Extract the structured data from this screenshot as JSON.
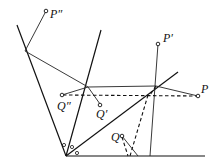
{
  "diagram": {
    "title": "",
    "labels": {
      "p_double_prime": "P″",
      "p_prime": "P′",
      "p": "P",
      "q_double_prime": "Q″",
      "q_prime": "Q′",
      "q": "Q"
    },
    "colors": {
      "stroke": "#111111",
      "background": "#ffffff"
    }
  }
}
